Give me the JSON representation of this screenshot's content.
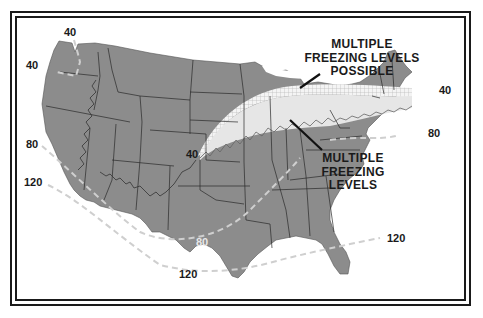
{
  "map": {
    "title": "Freezing levels over the contiguous United States",
    "colors": {
      "land": "#8c8c8c",
      "state_borders": "#2a2a2a",
      "isoline": "#c8c8c8",
      "multiple_levels_band": "#e6e6e6",
      "possible_band_hatch": "#f2f2f2",
      "frame": "#1a1a1a",
      "background": "#ffffff"
    },
    "callouts": [
      {
        "id": "possible",
        "lines": [
          "MULTIPLE",
          "FREEZING LEVELS",
          "POSSIBLE"
        ]
      },
      {
        "id": "multiple",
        "lines": [
          "MULTIPLE",
          "FREEZING",
          "LEVELS"
        ]
      }
    ],
    "isoline_labels": [
      {
        "value": "40",
        "position": "northwest-top"
      },
      {
        "value": "40",
        "position": "northwest-coast"
      },
      {
        "value": "80",
        "position": "west-coast"
      },
      {
        "value": "120",
        "position": "southwest-coast"
      },
      {
        "value": "40",
        "position": "central-plains"
      },
      {
        "value": "80",
        "position": "texas"
      },
      {
        "value": "120",
        "position": "gulf-of-mexico"
      },
      {
        "value": "120",
        "position": "southeast-atlantic"
      },
      {
        "value": "40",
        "position": "new-england"
      },
      {
        "value": "80",
        "position": "mid-atlantic"
      }
    ]
  }
}
